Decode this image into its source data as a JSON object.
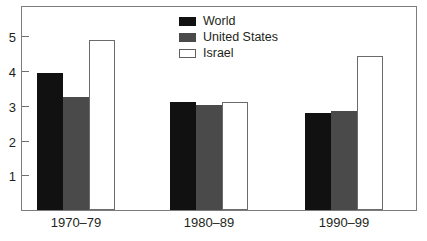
{
  "chart_data": {
    "type": "bar",
    "title": "",
    "subtitle": "",
    "xlabel": "",
    "ylabel": "",
    "categories": [
      "1970–79",
      "1980–89",
      "1990–99"
    ],
    "series": [
      {
        "name": "World",
        "color": "#111111",
        "values": [
          3.95,
          3.1,
          2.8
        ]
      },
      {
        "name": "United States",
        "color": "#4a4a4a",
        "values": [
          3.25,
          3.02,
          2.85
        ]
      },
      {
        "name": "Israel",
        "color": "#ffffff",
        "values": [
          4.9,
          3.1,
          4.45
        ]
      }
    ],
    "ylim": [
      0,
      5.85
    ],
    "yticks": [
      1,
      2,
      3,
      4,
      5
    ],
    "ytick_labels": [
      "1",
      "2",
      "3",
      "4",
      "5"
    ],
    "grid": false,
    "legend_position": "top-center",
    "frame_color": "#7d7d7d",
    "background": "#ffffff"
  },
  "legend": {
    "items": [
      {
        "label": "World",
        "swatch": "legend-swatch-world"
      },
      {
        "label": "United States",
        "swatch": "legend-swatch-united-states"
      },
      {
        "label": "Israel",
        "swatch": "legend-swatch-israel"
      }
    ]
  },
  "axes": {
    "y_tick_labels": [
      "5",
      "4",
      "3",
      "2",
      "1"
    ],
    "x_tick_labels": [
      "1970–79",
      "1980–89",
      "1990–99"
    ]
  }
}
